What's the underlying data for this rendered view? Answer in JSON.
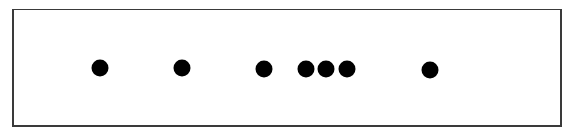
{
  "diagram": {
    "type": "dot-row",
    "frame": {
      "left": 12,
      "top": 9,
      "right": 563,
      "bottom": 128,
      "border_color": "#3a3a3a"
    },
    "dot_color": "#000000",
    "dot_diameter": 17,
    "dots": [
      {
        "x": 100,
        "y": 68
      },
      {
        "x": 182,
        "y": 68
      },
      {
        "x": 264,
        "y": 69
      },
      {
        "x": 306,
        "y": 69
      },
      {
        "x": 326,
        "y": 69
      },
      {
        "x": 347,
        "y": 69
      },
      {
        "x": 430,
        "y": 70
      }
    ]
  }
}
